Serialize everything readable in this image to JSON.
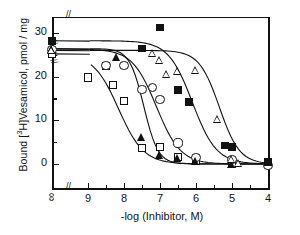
{
  "figure": {
    "xlabel": "-log (Inhibitor, M)",
    "ylabel_pre": "Bound [",
    "ylabel_sup": "3",
    "ylabel_post": "H]Vesamicol, pmol / mg",
    "ylabel_plain": "Bound [3H]Vesamicol, pmol / mg"
  },
  "axes": {
    "x_ticks": [
      "∞",
      "9",
      "8",
      "7",
      "6",
      "5",
      "4"
    ],
    "y_ticks": [
      "30",
      "20",
      "10",
      "0"
    ],
    "x_break_symbol": "//",
    "y_break_symbol": "//"
  },
  "chart_data": {
    "type": "scatter",
    "title": "",
    "xlabel": "-log (Inhibitor, M)",
    "ylabel": "Bound [3H]Vesamicol, pmol / mg",
    "xlim": [
      9.6,
      3.8
    ],
    "ylim": [
      -2,
      32
    ],
    "x_axis_note": "x axis is -log(Inhibitor, M), decreasing left to right; leftmost category is infinity (no inhibitor), separated by an axis break",
    "grid": false,
    "legend": "none",
    "y_ticks": [
      0,
      10,
      20,
      30
    ],
    "x_ticks": [
      "inf",
      9,
      8,
      7,
      6,
      5,
      4
    ],
    "series": [
      {
        "name": "open-squares",
        "marker": "open square",
        "color": "#111111",
        "points": [
          {
            "x": "inf",
            "y": 25.2
          },
          {
            "x": 9.0,
            "y": 19.8
          },
          {
            "x": 8.5,
            "y": 22.4
          },
          {
            "x": 8.3,
            "y": 18.0
          },
          {
            "x": 8.0,
            "y": 14.4
          },
          {
            "x": 7.5,
            "y": 3.7
          },
          {
            "x": 7.0,
            "y": 3.8
          },
          {
            "x": 6.5,
            "y": 1.6
          },
          {
            "x": 6.0,
            "y": 0.6
          },
          {
            "x": 5.0,
            "y": 0.1
          }
        ]
      },
      {
        "name": "open-circles",
        "marker": "open circle",
        "color": "#111111",
        "points": [
          {
            "x": "inf",
            "y": 26.2
          },
          {
            "x": 8.5,
            "y": 22.5
          },
          {
            "x": 8.0,
            "y": 22.5
          },
          {
            "x": 7.5,
            "y": 17.0
          },
          {
            "x": 7.2,
            "y": 17.4
          },
          {
            "x": 7.0,
            "y": 14.7
          },
          {
            "x": 6.5,
            "y": 4.8
          },
          {
            "x": 6.0,
            "y": 1.5
          },
          {
            "x": 5.0,
            "y": 1.1
          },
          {
            "x": 4.0,
            "y": -0.3
          }
        ]
      },
      {
        "name": "filled-triangles",
        "marker": "filled triangle",
        "color": "#111111",
        "points": [
          {
            "x": "inf",
            "y": 26.3
          },
          {
            "x": 8.2,
            "y": 24.4
          },
          {
            "x": 7.5,
            "y": 6.2
          },
          {
            "x": 7.0,
            "y": 2.0
          },
          {
            "x": 6.5,
            "y": 1.3
          },
          {
            "x": 6.0,
            "y": 0.6
          },
          {
            "x": 5.0,
            "y": -0.2
          }
        ]
      },
      {
        "name": "filled-squares",
        "marker": "filled square",
        "color": "#111111",
        "points": [
          {
            "x": "inf",
            "y": 28.2
          },
          {
            "x": 7.5,
            "y": 26.4
          },
          {
            "x": 7.0,
            "y": 31.2
          },
          {
            "x": 6.5,
            "y": 17.0
          },
          {
            "x": 6.2,
            "y": 14.2
          },
          {
            "x": 5.2,
            "y": 4.2
          },
          {
            "x": 5.0,
            "y": 3.9
          },
          {
            "x": 4.0,
            "y": 0.5
          }
        ]
      },
      {
        "name": "open-triangles",
        "marker": "open triangle",
        "color": "#111111",
        "points": [
          {
            "x": "inf",
            "y": 25.9
          },
          {
            "x": 7.2,
            "y": 25.3
          },
          {
            "x": 7.0,
            "y": 23.6
          },
          {
            "x": 6.8,
            "y": 20.4
          },
          {
            "x": 6.5,
            "y": 21.3
          },
          {
            "x": 6.0,
            "y": 21.4
          },
          {
            "x": 5.4,
            "y": 10.3
          },
          {
            "x": 5.0,
            "y": 1.0
          },
          {
            "x": 4.8,
            "y": 0.2
          }
        ]
      }
    ]
  }
}
